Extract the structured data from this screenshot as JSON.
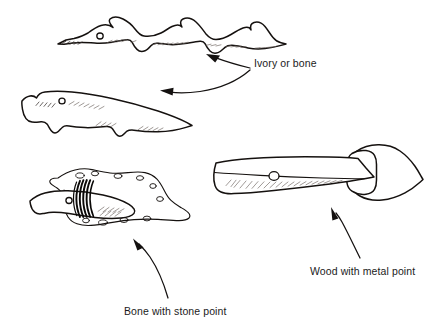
{
  "figure": {
    "background_color": "#ffffff",
    "ink_color": "#15110f",
    "style": "hand-drawn line illustration"
  },
  "labels": {
    "ivory_or_bone": "Ivory or bone",
    "bone_with_stone_point": "Bone with stone point",
    "wood_with_metal_point": "Wood with metal point"
  },
  "artifacts": [
    {
      "id": "barbed-bone-point",
      "name": "barbed harpoon head",
      "label_ref": "ivory_or_bone",
      "features": [
        "multiple barbs",
        "line hole",
        "hatched shading",
        "tapered tang"
      ]
    },
    {
      "id": "curved-bone-point",
      "name": "curved barbed point",
      "label_ref": "ivory_or_bone",
      "features": [
        "two barbs",
        "line hole",
        "hatched shading",
        "blunt butt"
      ]
    },
    {
      "id": "bone-shaft-stone-blade",
      "name": "bone shaft with hafted stone blade",
      "label_ref": "bone_with_stone_point",
      "features": [
        "knapped stone blade",
        "dark sinew lashing",
        "line hole",
        "bone foreshaft"
      ]
    },
    {
      "id": "wood-shaft-metal-blade",
      "name": "wood shaft with metal point",
      "label_ref": "wood_with_metal_point",
      "features": [
        "leaf-shaped metal blade",
        "socket",
        "line hole",
        "hatched shading"
      ]
    }
  ],
  "leaders": [
    {
      "id": "leader-ivory-up",
      "from": "ivory_or_bone",
      "to": "barbed-bone-point"
    },
    {
      "id": "leader-ivory-left",
      "from": "ivory_or_bone",
      "to": "curved-bone-point"
    },
    {
      "id": "leader-stone",
      "from": "bone_with_stone_point",
      "to": "bone-shaft-stone-blade"
    },
    {
      "id": "leader-metal",
      "from": "wood_with_metal_point",
      "to": "wood-shaft-metal-blade"
    }
  ]
}
